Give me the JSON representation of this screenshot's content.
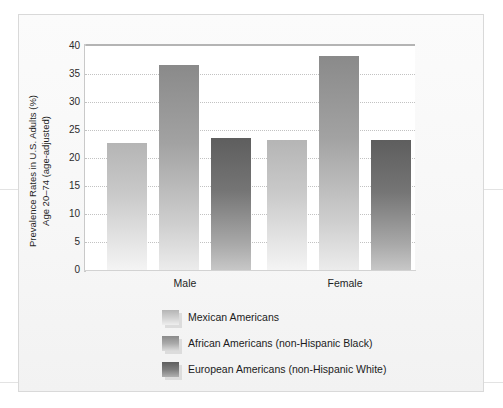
{
  "chart_data": {
    "type": "bar",
    "title": "",
    "subtitle": "",
    "xlabel": "",
    "ylabel": "Prevalence Rates in U.S. Adults (%)",
    "ylabel_line2": "Age 20–74 (age-adjusted)",
    "categories": [
      "Male",
      "Female"
    ],
    "ylim": [
      0,
      40
    ],
    "yticks": [
      0,
      5,
      10,
      15,
      20,
      25,
      30,
      35,
      40
    ],
    "ytick_labels": [
      "0",
      "5",
      "10",
      "15",
      "20",
      "25",
      "30",
      "35",
      "40"
    ],
    "grid": "horizontal-dotted",
    "legend_position": "below",
    "series": [
      {
        "name": "Mexican Americans",
        "color": "#c9c9c9",
        "values": [
          22.6,
          23.2
        ]
      },
      {
        "name": "African Americans (non-Hispanic Black)",
        "color": "#a2a2a2",
        "values": [
          36.6,
          38.2
        ]
      },
      {
        "name": "European Americans (non-Hispanic White)",
        "color": "#757575",
        "values": [
          23.5,
          23.3
        ]
      }
    ]
  },
  "figure": {
    "background_color": "#f7f7f7",
    "plot_background_color": "#ffffff",
    "border_color": "#d9d9d9"
  }
}
